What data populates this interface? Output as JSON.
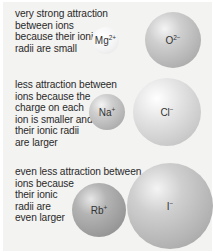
{
  "rows": [
    {
      "caption": "very strong attraction\nbetween ions\nbecause their ionic\nradii are small",
      "cation": {
        "symbol": "Mg",
        "charge": "2+"
      },
      "anion": {
        "symbol": "O",
        "charge": "2−"
      }
    },
    {
      "caption": "less attraction between\nions because the\ncharge on each\nion is smaller and\ntheir ionic radii\nare larger",
      "cation": {
        "symbol": "Na",
        "charge": "+"
      },
      "anion": {
        "symbol": "Cl",
        "charge": "−"
      }
    },
    {
      "caption": "even less attraction between\nions because\ntheir ionic\nradii are\neven larger",
      "cation": {
        "symbol": "Rb",
        "charge": "+"
      },
      "anion": {
        "symbol": "I",
        "charge": "−"
      }
    }
  ]
}
